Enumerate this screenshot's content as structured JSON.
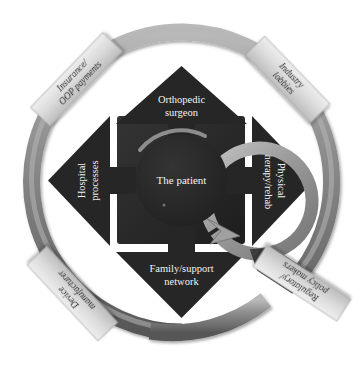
{
  "diagram": {
    "center": {
      "label": "The patient"
    },
    "colors": {
      "arrow_dark": "#272727",
      "hub_dark": "#2b2b2b",
      "ring_gray": "#8d8d8d",
      "ring_gray_dark": "#5e5e5e",
      "ring_gray_light": "#b4b4b4",
      "banner_light": "#dcdcdc",
      "banner_shadow": "#9a9a9a",
      "label_text": "#f2f2f2",
      "banner_text": "#181818",
      "background": "#ffffff"
    },
    "inner_arrows": [
      {
        "id": "top",
        "line1": "Orthopedic",
        "line2": "surgeon",
        "direction": "up"
      },
      {
        "id": "right",
        "line1": "Physical",
        "line2": "therapy/rehab",
        "direction": "right"
      },
      {
        "id": "bottom",
        "line1": "Family/support",
        "line2": "network",
        "direction": "down"
      },
      {
        "id": "left",
        "line1": "Hospital",
        "line2": "processes",
        "direction": "left"
      }
    ],
    "outer_banners": [
      {
        "id": "top-left",
        "line1": "Insurance/",
        "line2": "OOP payments",
        "position": "upper-left"
      },
      {
        "id": "top-right",
        "line1": "Industry",
        "line2": "lobbies",
        "position": "upper-right"
      },
      {
        "id": "bottom-left",
        "line1": "Device",
        "line2": "manufacturer",
        "position": "lower-left"
      },
      {
        "id": "bottom-right",
        "line1": "Regulatory/",
        "line2": "policy makers",
        "position": "lower-right-detached"
      }
    ]
  }
}
